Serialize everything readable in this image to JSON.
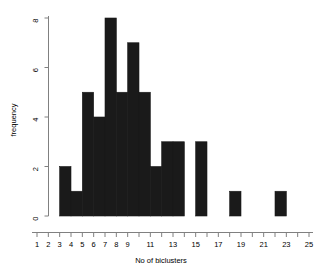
{
  "chart_data": {
    "type": "bar",
    "title": "",
    "xlabel": "No of biclusters",
    "ylabel": "frequency",
    "xlim": [
      1,
      25
    ],
    "ylim": [
      0,
      8
    ],
    "grid": false,
    "legend": null,
    "bin_width": 1,
    "categories": [
      3,
      4,
      5,
      6,
      7,
      8,
      9,
      10,
      11,
      12,
      13,
      14,
      15,
      16,
      17,
      18,
      19,
      20,
      21,
      22
    ],
    "values": [
      2,
      1,
      5,
      4,
      8,
      5,
      7,
      5,
      2,
      3,
      3,
      0,
      3,
      0,
      0,
      1,
      0,
      0,
      0,
      1
    ],
    "bins": [
      {
        "start": 3,
        "end": 4,
        "count": 2
      },
      {
        "start": 4,
        "end": 5,
        "count": 1
      },
      {
        "start": 5,
        "end": 6,
        "count": 5
      },
      {
        "start": 6,
        "end": 7,
        "count": 4
      },
      {
        "start": 7,
        "end": 8,
        "count": 8
      },
      {
        "start": 8,
        "end": 9,
        "count": 5
      },
      {
        "start": 9,
        "end": 10,
        "count": 7
      },
      {
        "start": 10,
        "end": 11,
        "count": 5
      },
      {
        "start": 11,
        "end": 12,
        "count": 2
      },
      {
        "start": 12,
        "end": 13,
        "count": 3
      },
      {
        "start": 13,
        "end": 14,
        "count": 3
      },
      {
        "start": 14,
        "end": 15,
        "count": 0
      },
      {
        "start": 15,
        "end": 16,
        "count": 3
      },
      {
        "start": 16,
        "end": 17,
        "count": 0
      },
      {
        "start": 17,
        "end": 18,
        "count": 0
      },
      {
        "start": 18,
        "end": 19,
        "count": 1
      },
      {
        "start": 19,
        "end": 20,
        "count": 0
      },
      {
        "start": 20,
        "end": 21,
        "count": 0
      },
      {
        "start": 21,
        "end": 22,
        "count": 0
      },
      {
        "start": 22,
        "end": 23,
        "count": 1
      }
    ],
    "x_ticks": [
      1,
      2,
      3,
      4,
      5,
      6,
      7,
      8,
      9,
      10,
      11,
      12,
      13,
      14,
      15,
      16,
      17,
      18,
      19,
      20,
      21,
      22,
      23,
      24,
      25
    ],
    "x_tick_labels": [
      "1",
      "2",
      "3",
      "4",
      "5",
      "6",
      "7",
      "8",
      "9",
      "",
      "11",
      "",
      "13",
      "",
      "15",
      "",
      "17",
      "",
      "19",
      "",
      "21",
      "",
      "23",
      "",
      "25"
    ],
    "y_ticks": [
      0,
      2,
      4,
      6,
      8
    ],
    "y_tick_labels": [
      "0",
      "2",
      "4",
      "6",
      "8"
    ],
    "bar_color": "#1a1a1a",
    "axis_color": "#808080",
    "text_color": "#000000"
  }
}
